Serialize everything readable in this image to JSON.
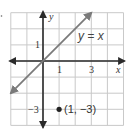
{
  "chart_data": {
    "type": "line",
    "title": "",
    "xlabel": "x",
    "ylabel": "y",
    "xlim": [
      -2,
      5
    ],
    "ylim": [
      -4,
      3
    ],
    "grid": true,
    "x_ticks": [
      {
        "value": 1,
        "label": "1"
      },
      {
        "value": 3,
        "label": "3"
      }
    ],
    "y_ticks": [
      {
        "value": 1,
        "label": "1"
      },
      {
        "value": -3,
        "label": "−3"
      }
    ],
    "series": [
      {
        "name": "y = x",
        "x": [
          -2,
          3
        ],
        "y": [
          -2,
          3
        ],
        "arrows": "both"
      }
    ],
    "points": [
      {
        "x": 1,
        "y": -3,
        "label": "(1, −3)"
      }
    ],
    "annotations": [
      {
        "text": "y = x",
        "x": 2.35,
        "y": 1.55
      }
    ],
    "colors": {
      "axis": "#2a2a2a",
      "line": "#7a7a7a",
      "grid": "#c9c9c9",
      "point": "#222222"
    }
  }
}
